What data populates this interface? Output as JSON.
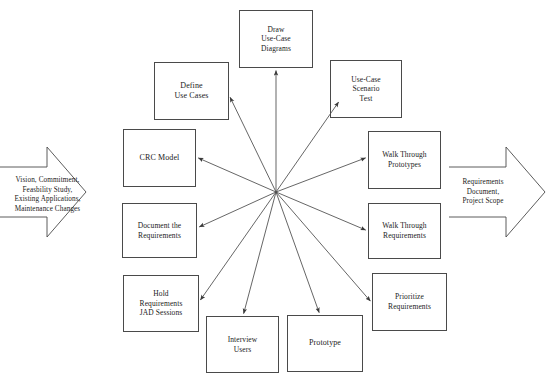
{
  "diagram": {
    "stroke_color": "#4a4a4a",
    "text_color": "#1a1a1a",
    "background_color": "#ffffff",
    "hub": {
      "x": 276,
      "y": 192,
      "label": "central-hub"
    },
    "input_arrow": {
      "name": "input-arrow",
      "direction": "right",
      "lines": [
        "Vision, Commitment,",
        "Feasbility Study,",
        "Existing Applications,",
        "Maintenance Changes"
      ]
    },
    "output_arrow": {
      "name": "output-arrow",
      "direction": "right",
      "lines": [
        "Requirements",
        "Document,",
        "Project Scope"
      ]
    },
    "nodes": [
      {
        "id": "draw-use-case-diagrams",
        "lines": [
          "Draw",
          "Use-Case",
          "Diagrams"
        ],
        "x": 239,
        "y": 10,
        "w": 74,
        "h": 58,
        "font_size": 7.5,
        "anchor": {
          "x": 276,
          "y": 68
        }
      },
      {
        "id": "define-use-cases",
        "lines": [
          "Define",
          "Use Cases"
        ],
        "x": 154,
        "y": 62,
        "w": 75,
        "h": 58,
        "font_size": 8,
        "anchor": {
          "x": 229,
          "y": 95
        }
      },
      {
        "id": "use-case-scenario-test",
        "lines": [
          "Use-Case",
          "Scenario",
          "Test"
        ],
        "x": 330,
        "y": 60,
        "w": 72,
        "h": 58,
        "font_size": 7.5,
        "anchor": {
          "x": 340,
          "y": 100
        }
      },
      {
        "id": "crc-model",
        "lines": [
          "CRC Model"
        ],
        "x": 123,
        "y": 129,
        "w": 73,
        "h": 58,
        "font_size": 8,
        "anchor": {
          "x": 196,
          "y": 157
        }
      },
      {
        "id": "walk-through-prototypes",
        "lines": [
          "Walk Through",
          "Prototypes"
        ],
        "x": 368,
        "y": 131,
        "w": 73,
        "h": 58,
        "font_size": 7.5,
        "anchor": {
          "x": 368,
          "y": 157
        }
      },
      {
        "id": "document-the-requirements",
        "lines": [
          "Document the",
          "Requirements"
        ],
        "x": 122,
        "y": 203,
        "w": 75,
        "h": 55,
        "font_size": 7.5,
        "anchor": {
          "x": 197,
          "y": 228
        }
      },
      {
        "id": "walk-through-requirements",
        "lines": [
          "Walk Through",
          "Requirements"
        ],
        "x": 368,
        "y": 203,
        "w": 73,
        "h": 56,
        "font_size": 7.5,
        "anchor": {
          "x": 368,
          "y": 231
        }
      },
      {
        "id": "hold-requirements-jad-sessions",
        "lines": [
          "Hold",
          "Requirements",
          "JAD Sessions"
        ],
        "x": 123,
        "y": 275,
        "w": 76,
        "h": 57,
        "font_size": 7.5,
        "anchor": {
          "x": 199,
          "y": 302
        }
      },
      {
        "id": "prioritize-requirements",
        "lines": [
          "Prioritize",
          "Requirements"
        ],
        "x": 372,
        "y": 273,
        "w": 75,
        "h": 58,
        "font_size": 7.5,
        "anchor": {
          "x": 372,
          "y": 303
        }
      },
      {
        "id": "interview-users",
        "lines": [
          "Interview",
          "Users"
        ],
        "x": 206,
        "y": 316,
        "w": 73,
        "h": 57,
        "font_size": 7.5,
        "anchor": {
          "x": 243,
          "y": 316
        }
      },
      {
        "id": "prototype",
        "lines": [
          "Prototype"
        ],
        "x": 287,
        "y": 315,
        "w": 76,
        "h": 57,
        "font_size": 8,
        "anchor": {
          "x": 320,
          "y": 315
        }
      }
    ]
  }
}
